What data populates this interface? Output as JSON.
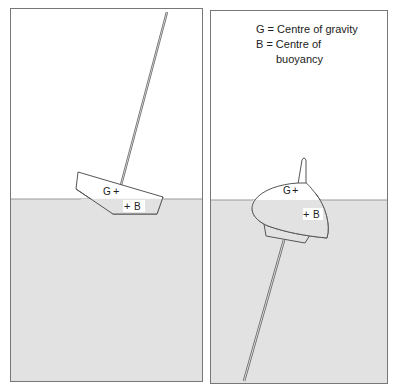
{
  "legend": {
    "line1": "G = Centre of gravity",
    "line2": "B = Centre of",
    "line3": "buoyancy"
  },
  "left_panel": {
    "g_label": "G",
    "b_label": "B"
  },
  "right_panel": {
    "g_label": "G",
    "b_label": "B"
  },
  "colors": {
    "water": "#e2e2e2",
    "sky": "#ffffff",
    "outline": "#555555"
  }
}
